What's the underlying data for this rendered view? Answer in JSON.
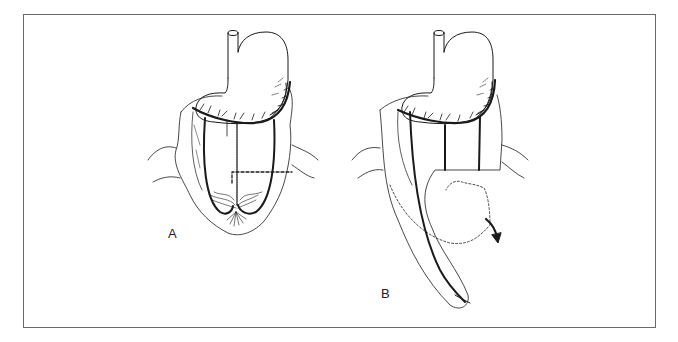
{
  "figure": {
    "panels": [
      {
        "id": "A",
        "label": "A",
        "description": "Stomach with greater omentum; gastroepiploic arcade intact, dashed incision line on omentum"
      },
      {
        "id": "B",
        "label": "B",
        "description": "Omentum divided and lengthened into pedicled flap; dotted outline shows original position, curved arrow shows rotation"
      }
    ],
    "colors": {
      "line": "#1a1a1a",
      "frame": "#6a6a6a",
      "background": "#ffffff"
    }
  }
}
